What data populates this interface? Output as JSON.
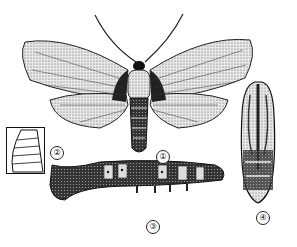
{
  "figure": {
    "labels": [
      {
        "id": "adult",
        "text": "①"
      },
      {
        "id": "egg-detail",
        "text": "②"
      },
      {
        "id": "larva",
        "text": "③"
      },
      {
        "id": "pupa",
        "text": "④"
      }
    ]
  }
}
